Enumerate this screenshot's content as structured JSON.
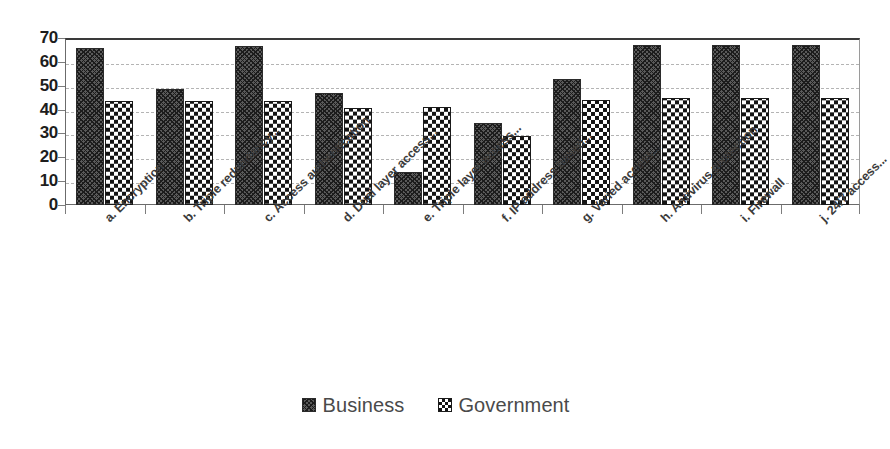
{
  "chart_data": {
    "type": "bar",
    "title": "",
    "xlabel": "",
    "ylabel": "",
    "ylim": [
      0,
      70
    ],
    "y_ticks": [
      0,
      10,
      20,
      30,
      40,
      50,
      60,
      70
    ],
    "grid": true,
    "legend_position": "bottom",
    "categories": [
      "a. Encryption",
      "b. Triple redundancy...",
      "c. Access authentication",
      "d. Dual layer access...",
      "e. Triple layer access...",
      "f. IP address based...",
      "g. Varied access...",
      "h. Antivirus protection",
      "i. Firewall",
      "j. 24/7 access..."
    ],
    "series": [
      {
        "name": "Business",
        "pattern": "dense-diamond-hatch",
        "values": [
          66,
          48.5,
          66.5,
          47,
          14,
          34.5,
          53,
          67,
          67,
          67
        ]
      },
      {
        "name": "Government",
        "pattern": "checkerboard",
        "values": [
          43.5,
          43.5,
          43.5,
          40.5,
          41,
          29,
          44,
          45,
          45,
          45
        ]
      }
    ]
  },
  "legend": {
    "entries": [
      {
        "label": "Business",
        "swatch": "business-pattern-swatch"
      },
      {
        "label": "Government",
        "swatch": "government-pattern-swatch"
      }
    ]
  }
}
